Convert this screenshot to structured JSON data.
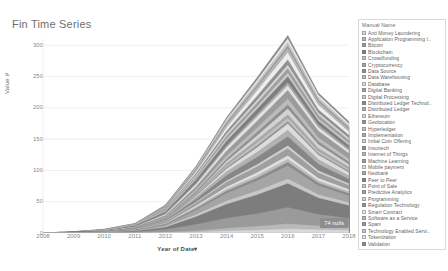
{
  "title": "Fin Time Series",
  "axes": {
    "y_title": "Value #",
    "x_title": "Year of Date",
    "x_sort_caret": "▾",
    "y_ticks": [
      "300",
      "250",
      "200",
      "150",
      "100",
      "50",
      "0"
    ],
    "x_ticks": [
      "2008",
      "2009",
      "2010",
      "2011",
      "2012",
      "2013",
      "2014",
      "2015",
      "2016",
      "2017",
      "2018"
    ]
  },
  "nulls_badge": "74 nulls",
  "legend": {
    "title": "Manual Name",
    "items": [
      {
        "label": "Anti Money Laundering",
        "color": "#d8d8d8"
      },
      {
        "label": "Application Programming I..",
        "color": "#b9b9b9"
      },
      {
        "label": "Bitcoin",
        "color": "#9a9a9a"
      },
      {
        "label": "Blockchain",
        "color": "#7d7d7d"
      },
      {
        "label": "Crowdfunding",
        "color": "#c7c7c7"
      },
      {
        "label": "Cryptocurrency",
        "color": "#a5a5a5"
      },
      {
        "label": "Data Source",
        "color": "#8c8c8c"
      },
      {
        "label": "Data Warehousing",
        "color": "#bdbdbd"
      },
      {
        "label": "Database",
        "color": "#e0e0e0"
      },
      {
        "label": "Digital Banking",
        "color": "#9f9f9f"
      },
      {
        "label": "Digital Processing",
        "color": "#cfcfcf"
      },
      {
        "label": "Distributed Ledger Technol..",
        "color": "#868686"
      },
      {
        "label": "Distributed Ledger",
        "color": "#b1b1b1"
      },
      {
        "label": "Ethereum",
        "color": "#dcdcdc"
      },
      {
        "label": "Geolocation",
        "color": "#949494"
      },
      {
        "label": "Hyperledger",
        "color": "#c2c2c2"
      },
      {
        "label": "Implementation",
        "color": "#a9a9a9"
      },
      {
        "label": "Initial Coin Offering",
        "color": "#d3d3d3"
      },
      {
        "label": "Insurtech",
        "color": "#8f8f8f"
      },
      {
        "label": "Internet of Things",
        "color": "#bbbbbb"
      },
      {
        "label": "Machine Learning",
        "color": "#9c9c9c"
      },
      {
        "label": "Mobile payment",
        "color": "#e3e3e3"
      },
      {
        "label": "Neobank",
        "color": "#ababab"
      },
      {
        "label": "Peer to Peer",
        "color": "#7f7f7f"
      },
      {
        "label": "Point of Sale",
        "color": "#cacaca"
      },
      {
        "label": "Predictive Analytics",
        "color": "#a0a0a0"
      },
      {
        "label": "Programming",
        "color": "#d6d6d6"
      },
      {
        "label": "Regulation Technology",
        "color": "#919191"
      },
      {
        "label": "Smart Contract",
        "color": "#ededed"
      },
      {
        "label": "Software as a Service",
        "color": "#b6b6b6"
      },
      {
        "label": "Spam",
        "color": "#989898"
      },
      {
        "label": "Technology Enabled Servi..",
        "color": "#c5c5c5"
      },
      {
        "label": "Tokenization",
        "color": "#e6e6e6"
      },
      {
        "label": "Validation",
        "color": "#8a8a8a"
      }
    ]
  },
  "chart_data": {
    "type": "area",
    "stacked": true,
    "title": "Fin Time Series",
    "xlabel": "Year of Date",
    "ylabel": "Value #",
    "x": [
      2008,
      2009,
      2010,
      2011,
      2012,
      2013,
      2014,
      2015,
      2016,
      2017,
      2018
    ],
    "ylim": [
      0,
      310
    ],
    "yticks": [
      0,
      50,
      100,
      150,
      200,
      250,
      300
    ],
    "grid": true,
    "legend_position": "right",
    "series": [
      {
        "name": "Anti Money Laundering",
        "color": "#d8d8d8",
        "values": [
          0,
          0,
          0,
          0,
          1,
          2,
          4,
          5,
          7,
          6,
          5
        ]
      },
      {
        "name": "Application Programming I..",
        "color": "#b9b9b9",
        "values": [
          0,
          0,
          0,
          0,
          1,
          2,
          4,
          6,
          8,
          6,
          5
        ]
      },
      {
        "name": "Bitcoin",
        "color": "#9a9a9a",
        "values": [
          0,
          1,
          1,
          2,
          4,
          10,
          16,
          20,
          26,
          18,
          14
        ]
      },
      {
        "name": "Blockchain",
        "color": "#7d7d7d",
        "values": [
          0,
          0,
          0,
          1,
          3,
          12,
          22,
          30,
          38,
          26,
          20
        ]
      },
      {
        "name": "Crowdfunding",
        "color": "#c7c7c7",
        "values": [
          0,
          0,
          1,
          1,
          2,
          4,
          6,
          7,
          8,
          6,
          5
        ]
      },
      {
        "name": "Cryptocurrency",
        "color": "#a5a5a5",
        "values": [
          0,
          0,
          0,
          1,
          2,
          7,
          12,
          16,
          21,
          14,
          11
        ]
      },
      {
        "name": "Data Source",
        "color": "#8c8c8c",
        "values": [
          0,
          0,
          0,
          0,
          1,
          2,
          3,
          4,
          5,
          4,
          3
        ]
      },
      {
        "name": "Data Warehousing",
        "color": "#bdbdbd",
        "values": [
          0,
          0,
          0,
          0,
          1,
          2,
          3,
          4,
          5,
          3,
          3
        ]
      },
      {
        "name": "Database",
        "color": "#e0e0e0",
        "values": [
          0,
          0,
          0,
          1,
          1,
          3,
          4,
          5,
          6,
          5,
          4
        ]
      },
      {
        "name": "Digital Banking",
        "color": "#9f9f9f",
        "values": [
          0,
          0,
          0,
          1,
          2,
          4,
          7,
          9,
          11,
          8,
          6
        ]
      },
      {
        "name": "Digital Processing",
        "color": "#cfcfcf",
        "values": [
          0,
          0,
          0,
          0,
          1,
          2,
          3,
          4,
          5,
          4,
          3
        ]
      },
      {
        "name": "Distributed Ledger Technol..",
        "color": "#868686",
        "values": [
          0,
          0,
          0,
          0,
          1,
          4,
          8,
          11,
          14,
          10,
          7
        ]
      },
      {
        "name": "Distributed Ledger",
        "color": "#b1b1b1",
        "values": [
          0,
          0,
          0,
          0,
          1,
          3,
          6,
          8,
          10,
          7,
          5
        ]
      },
      {
        "name": "Ethereum",
        "color": "#dcdcdc",
        "values": [
          0,
          0,
          0,
          0,
          0,
          2,
          5,
          8,
          11,
          8,
          6
        ]
      },
      {
        "name": "Geolocation",
        "color": "#949494",
        "values": [
          0,
          0,
          0,
          0,
          1,
          1,
          2,
          3,
          3,
          2,
          2
        ]
      },
      {
        "name": "Hyperledger",
        "color": "#c2c2c2",
        "values": [
          0,
          0,
          0,
          0,
          0,
          1,
          3,
          5,
          6,
          4,
          3
        ]
      },
      {
        "name": "Implementation",
        "color": "#a9a9a9",
        "values": [
          0,
          0,
          0,
          0,
          1,
          2,
          3,
          4,
          5,
          4,
          3
        ]
      },
      {
        "name": "Initial Coin Offering",
        "color": "#d3d3d3",
        "values": [
          0,
          0,
          0,
          0,
          0,
          1,
          4,
          7,
          10,
          7,
          5
        ]
      },
      {
        "name": "Insurtech",
        "color": "#8f8f8f",
        "values": [
          0,
          0,
          0,
          0,
          1,
          2,
          3,
          5,
          6,
          4,
          3
        ]
      },
      {
        "name": "Internet of Things",
        "color": "#bbbbbb",
        "values": [
          0,
          0,
          0,
          1,
          2,
          4,
          6,
          8,
          10,
          7,
          6
        ]
      },
      {
        "name": "Machine Learning",
        "color": "#9c9c9c",
        "values": [
          0,
          0,
          0,
          1,
          2,
          4,
          7,
          10,
          13,
          10,
          8
        ]
      },
      {
        "name": "Mobile payment",
        "color": "#e3e3e3",
        "values": [
          0,
          0,
          1,
          1,
          2,
          4,
          6,
          7,
          8,
          6,
          5
        ]
      },
      {
        "name": "Neobank",
        "color": "#ababab",
        "values": [
          0,
          0,
          0,
          0,
          1,
          2,
          3,
          4,
          5,
          4,
          3
        ]
      },
      {
        "name": "Peer to Peer",
        "color": "#7f7f7f",
        "values": [
          0,
          1,
          1,
          2,
          3,
          5,
          7,
          8,
          9,
          6,
          5
        ]
      },
      {
        "name": "Point of Sale",
        "color": "#cacaca",
        "values": [
          0,
          0,
          1,
          1,
          2,
          3,
          4,
          5,
          6,
          4,
          4
        ]
      },
      {
        "name": "Predictive Analytics",
        "color": "#a0a0a0",
        "values": [
          0,
          0,
          0,
          0,
          1,
          2,
          4,
          5,
          7,
          5,
          4
        ]
      },
      {
        "name": "Programming",
        "color": "#d6d6d6",
        "values": [
          0,
          0,
          0,
          1,
          1,
          3,
          4,
          5,
          6,
          4,
          4
        ]
      },
      {
        "name": "Regulation Technology",
        "color": "#919191",
        "values": [
          0,
          0,
          0,
          0,
          1,
          2,
          4,
          6,
          8,
          5,
          4
        ]
      },
      {
        "name": "Smart Contract",
        "color": "#ededed",
        "values": [
          0,
          0,
          0,
          0,
          1,
          3,
          6,
          9,
          12,
          8,
          6
        ]
      },
      {
        "name": "Software as a Service",
        "color": "#b6b6b6",
        "values": [
          0,
          0,
          1,
          1,
          2,
          3,
          5,
          6,
          7,
          5,
          4
        ]
      },
      {
        "name": "Spam",
        "color": "#989898",
        "values": [
          0,
          0,
          0,
          0,
          1,
          1,
          2,
          2,
          3,
          2,
          2
        ]
      },
      {
        "name": "Technology Enabled Servi..",
        "color": "#c5c5c5",
        "values": [
          0,
          0,
          0,
          0,
          1,
          2,
          3,
          4,
          5,
          4,
          3
        ]
      },
      {
        "name": "Tokenization",
        "color": "#e6e6e6",
        "values": [
          0,
          0,
          0,
          0,
          0,
          1,
          3,
          5,
          7,
          5,
          4
        ]
      },
      {
        "name": "Validation",
        "color": "#8a8a8a",
        "values": [
          0,
          0,
          0,
          0,
          1,
          2,
          3,
          4,
          5,
          3,
          3
        ]
      }
    ]
  }
}
